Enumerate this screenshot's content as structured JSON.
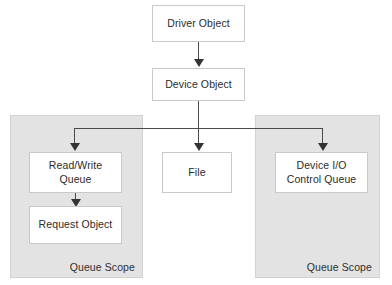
{
  "diagram": {
    "colors": {
      "scope_fill": "#e3e3e3",
      "scope_border": "#d2d2d2",
      "node_fill": "#ffffff",
      "node_border": "#c9c9c9",
      "connector": "#4a4a4a",
      "arrowhead": "#333333",
      "text": "#2b2b2b",
      "background": "#ffffff"
    },
    "nodes": {
      "driver_object": "Driver Object",
      "device_object": "Device Object",
      "read_write_queue_line1": "Read/Write",
      "read_write_queue_line2": "Queue",
      "request_object": "Request Object",
      "file": "File",
      "device_io_line1": "Device I/O",
      "device_io_line2": "Control Queue"
    },
    "scopes": {
      "left_label": "Queue Scope",
      "right_label": "Queue Scope"
    },
    "connectors": [
      {
        "name": "driver-object-to-device-object",
        "from": "Driver Object",
        "to": "Device Object",
        "arrow": "down"
      },
      {
        "name": "device-object-to-file",
        "from": "Device Object",
        "to": "File",
        "arrow": "down"
      },
      {
        "name": "device-object-to-read-write-queue",
        "from": "Device Object",
        "to": "Read/Write Queue",
        "arrow": "down"
      },
      {
        "name": "device-object-to-device-io-control-queue",
        "from": "Device Object",
        "to": "Device I/O Control Queue",
        "arrow": "down"
      },
      {
        "name": "read-write-queue-to-request-object",
        "from": "Read/Write Queue",
        "to": "Request Object",
        "arrow": "down"
      }
    ]
  }
}
